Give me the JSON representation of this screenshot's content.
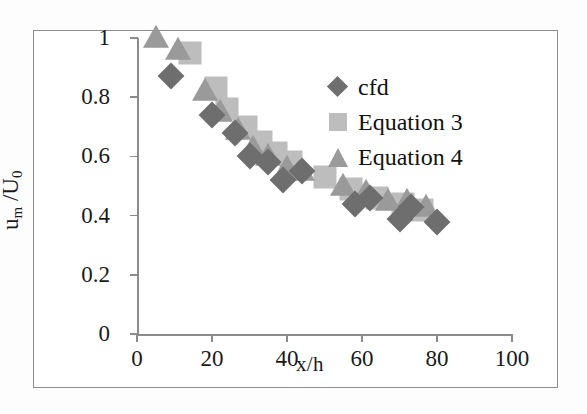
{
  "chart_data": {
    "type": "scatter",
    "title": "",
    "xlabel": "x/h",
    "ylabel": "u_m /U_0",
    "xlim": [
      0,
      100
    ],
    "ylim": [
      0,
      1
    ],
    "xticks": [
      "0",
      "20",
      "40",
      "60",
      "80",
      "100"
    ],
    "yticks": [
      "0",
      "0.2",
      "0.4",
      "0.6",
      "0.8",
      "1"
    ],
    "grid": false,
    "legend_position": "upper-right-inside",
    "series": [
      {
        "name": "cfd",
        "marker": "diamond",
        "color": "#6e6e6e",
        "points": [
          {
            "x": 9,
            "y": 0.87
          },
          {
            "x": 20,
            "y": 0.74
          },
          {
            "x": 26,
            "y": 0.68
          },
          {
            "x": 30,
            "y": 0.6
          },
          {
            "x": 35,
            "y": 0.58
          },
          {
            "x": 39,
            "y": 0.52
          },
          {
            "x": 44,
            "y": 0.55
          },
          {
            "x": 58,
            "y": 0.44
          },
          {
            "x": 62,
            "y": 0.46
          },
          {
            "x": 70,
            "y": 0.39
          },
          {
            "x": 73,
            "y": 0.43
          },
          {
            "x": 80,
            "y": 0.38
          }
        ]
      },
      {
        "name": "Equation 3",
        "marker": "square",
        "color": "#bdbdbd",
        "points": [
          {
            "x": 14,
            "y": 0.95
          },
          {
            "x": 21,
            "y": 0.83
          },
          {
            "x": 24,
            "y": 0.76
          },
          {
            "x": 29,
            "y": 0.7
          },
          {
            "x": 33,
            "y": 0.65
          },
          {
            "x": 37,
            "y": 0.61
          },
          {
            "x": 41,
            "y": 0.58
          },
          {
            "x": 50,
            "y": 0.53
          },
          {
            "x": 57,
            "y": 0.49
          },
          {
            "x": 64,
            "y": 0.46
          },
          {
            "x": 71,
            "y": 0.44
          },
          {
            "x": 76,
            "y": 0.42
          }
        ]
      },
      {
        "name": "Equation 4",
        "marker": "triangle",
        "color": "#9a9a9a",
        "points": [
          {
            "x": 5,
            "y": 1.0
          },
          {
            "x": 11,
            "y": 0.96
          },
          {
            "x": 18,
            "y": 0.82
          },
          {
            "x": 22,
            "y": 0.75
          },
          {
            "x": 27,
            "y": 0.69
          },
          {
            "x": 31,
            "y": 0.63
          },
          {
            "x": 35,
            "y": 0.6
          },
          {
            "x": 40,
            "y": 0.56
          },
          {
            "x": 44,
            "y": 0.55
          },
          {
            "x": 55,
            "y": 0.5
          },
          {
            "x": 61,
            "y": 0.48
          },
          {
            "x": 67,
            "y": 0.45
          },
          {
            "x": 72,
            "y": 0.45
          },
          {
            "x": 77,
            "y": 0.43
          }
        ]
      }
    ]
  },
  "axes": {
    "y_label_main": "u",
    "y_label_sub1": "m",
    "y_label_mid": " /U",
    "y_label_sub2": "0",
    "x_title": "x/h"
  },
  "legend": {
    "items": [
      {
        "label": "cfd",
        "marker": "diamond"
      },
      {
        "label": "Equation 3",
        "marker": "square"
      },
      {
        "label": "Equation 4",
        "marker": "triangle"
      }
    ]
  }
}
